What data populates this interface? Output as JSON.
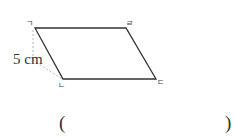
{
  "figure": {
    "shape": "parallelogram",
    "vertices": {
      "top_left": "ㄱ",
      "top_right": "ㄹ",
      "bottom_left": "ㄴ",
      "bottom_right": "ㄷ"
    },
    "measurement": "5 cm",
    "stroke_color": "#333333",
    "dash_color": "#b0b0b0"
  },
  "answer": {
    "open_paren": "(",
    "close_paren": ")"
  }
}
